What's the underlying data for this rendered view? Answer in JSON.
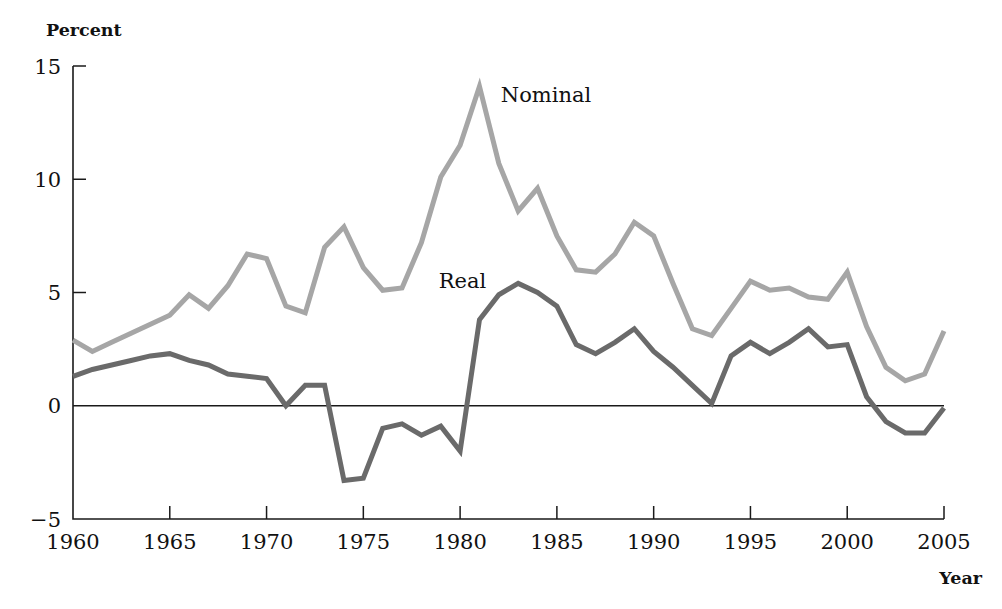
{
  "figure": {
    "background": "#ffffff",
    "width": 1002,
    "height": 609
  },
  "labels": {
    "y_axis_title": "Percent",
    "x_axis_title": "Year",
    "nominal_label": "Nominal",
    "real_label": "Real"
  },
  "chart_data": {
    "type": "line",
    "title": "",
    "subtitle": "",
    "xlabel": "Year",
    "ylabel": "Percent",
    "xlim": [
      1960,
      2005
    ],
    "ylim": [
      -5,
      15
    ],
    "grid": false,
    "legend_position": "inline-annotation",
    "x_ticks": [
      1960,
      1965,
      1970,
      1975,
      1980,
      1985,
      1990,
      1995,
      2000,
      2005
    ],
    "y_ticks": [
      -5,
      0,
      5,
      10,
      15
    ],
    "x_tick_labels": [
      "1960",
      "1965",
      "1970",
      "1975",
      "1980",
      "1985",
      "1990",
      "1995",
      "2000",
      "2005"
    ],
    "y_tick_labels": [
      "−5",
      "0",
      "5",
      "10",
      "15"
    ],
    "x": [
      1960,
      1961,
      1962,
      1963,
      1964,
      1965,
      1966,
      1967,
      1968,
      1969,
      1970,
      1971,
      1972,
      1973,
      1974,
      1975,
      1976,
      1977,
      1978,
      1979,
      1980,
      1981,
      1982,
      1983,
      1984,
      1985,
      1986,
      1987,
      1988,
      1989,
      1990,
      1991,
      1992,
      1993,
      1994,
      1995,
      1996,
      1997,
      1998,
      1999,
      2000,
      2001,
      2002,
      2003,
      2004,
      2005
    ],
    "series": [
      {
        "name": "Nominal",
        "color": "#a6a6a6",
        "stroke_width": 5.0,
        "annotation": "Nominal",
        "annotation_x": 1982.1,
        "annotation_y": 13.4,
        "values": [
          2.9,
          2.4,
          2.8,
          3.2,
          3.6,
          4.0,
          4.9,
          4.3,
          5.3,
          6.7,
          6.5,
          4.4,
          4.1,
          7.0,
          7.9,
          6.1,
          5.1,
          5.2,
          7.2,
          10.1,
          11.5,
          14.1,
          10.7,
          8.6,
          9.6,
          7.5,
          6.0,
          5.9,
          6.7,
          8.1,
          7.5,
          5.4,
          3.4,
          3.1,
          4.3,
          5.5,
          5.1,
          5.2,
          4.8,
          4.7,
          5.9,
          3.5,
          1.7,
          1.1,
          1.4,
          3.3
        ]
      },
      {
        "name": "Real",
        "color": "#6a6a6a",
        "stroke_width": 5.0,
        "annotation": "Real",
        "annotation_x": 1978.9,
        "annotation_y": 5.2,
        "values": [
          1.3,
          1.6,
          1.8,
          2.0,
          2.2,
          2.3,
          2.0,
          1.8,
          1.4,
          1.3,
          1.2,
          0.0,
          0.9,
          0.9,
          -3.3,
          -3.2,
          -1.0,
          -0.8,
          -1.3,
          -0.9,
          -2.0,
          3.8,
          4.9,
          5.4,
          5.0,
          4.4,
          2.7,
          2.3,
          2.8,
          3.4,
          2.4,
          1.7,
          0.9,
          0.1,
          2.2,
          2.8,
          2.3,
          2.8,
          3.4,
          2.6,
          2.7,
          0.4,
          -0.7,
          -1.2,
          -1.2,
          -0.1
        ]
      }
    ]
  }
}
